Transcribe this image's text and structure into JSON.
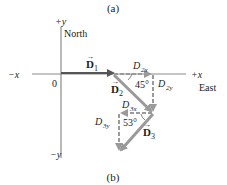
{
  "panel_labels": {
    "top": "(a)",
    "bottom": "(b)"
  },
  "axes": {
    "plus_y": "+y",
    "north": "North",
    "minus_x": "−x",
    "plus_x": "+x",
    "east": "East",
    "origin": "0",
    "minus_y": "−y"
  },
  "vectors": {
    "d1": {
      "name": "D",
      "sub": "1"
    },
    "d2": {
      "name": "D",
      "sub": "2"
    },
    "d3": {
      "name": "D",
      "sub": "3"
    }
  },
  "components": {
    "d2x": {
      "name": "D",
      "sub": "2x"
    },
    "d2y": {
      "name": "D",
      "sub": "2y"
    },
    "d3x": {
      "name": "D",
      "sub": "3x"
    },
    "d3y": {
      "name": "D",
      "sub": "3y"
    }
  },
  "angles": {
    "d2": "45°",
    "d3": "53°"
  },
  "colors": {
    "axis": "#8a8a8a",
    "vector": "#9a9a9a",
    "d1": "#555555",
    "text": "#222222"
  }
}
